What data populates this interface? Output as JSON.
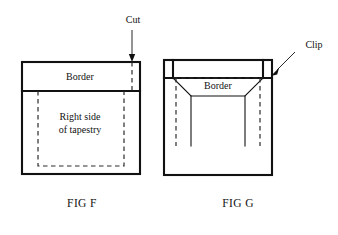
{
  "figures": [
    {
      "id": "fig-f",
      "caption": "FIG F",
      "caption_x": 82,
      "caption_y": 207,
      "border_label": "Border",
      "border_label_x": 80,
      "border_label_y": 76,
      "body_label_line1": "Right side",
      "body_label_line2": "of tapestry",
      "body_label_x": 80,
      "body_label_y": 121,
      "callout": {
        "name": "cut",
        "label": "Cut",
        "label_x": 133,
        "label_y": 23
      },
      "outer_rect": {
        "x": 22,
        "y": 62,
        "width": 118,
        "height": 112
      },
      "border_band": {
        "x": 22,
        "y": 62,
        "width": 118,
        "height": 29
      },
      "dashed_rect": {
        "x": 38,
        "y": 91,
        "width": 86,
        "height": 75
      },
      "cut_line_x": 132
    },
    {
      "id": "fig-g",
      "caption": "FIG G",
      "caption_x": 238,
      "caption_y": 207,
      "border_label": "Border",
      "border_label_x": 218,
      "border_label_y": 85,
      "callout": {
        "name": "clip",
        "label": "Clip",
        "label_x": 314,
        "label_y": 48
      },
      "outer_rect": {
        "x": 164,
        "y": 60,
        "width": 108,
        "height": 115
      },
      "notch_depth": 18,
      "notch_left_inner_x": 173,
      "notch_right_inner_x": 263,
      "trapezoid_top_y": 78,
      "trapezoid_bottom_y": 96,
      "trapezoid_bottom_left_x": 191,
      "trapezoid_bottom_right_x": 245,
      "dashed_vertical_bottom_y": 146,
      "solid_vertical_bottom_y": 146
    }
  ],
  "colors": {
    "ink": "#111111",
    "dashed_ink": "#2a2a2a",
    "background": "#ffffff"
  }
}
